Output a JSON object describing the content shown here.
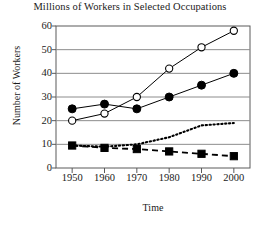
{
  "chart_data": {
    "type": "line",
    "title": "Millions of Workers in Selected Occupations",
    "xlabel": "Time",
    "ylabel": "Number of Workers",
    "x": [
      1950,
      1960,
      1970,
      1980,
      1990,
      2000
    ],
    "xtick_labels": [
      "1950",
      "1960",
      "1970",
      "1980",
      "1990",
      "2000"
    ],
    "ytick_labels": [
      "0",
      "10",
      "20",
      "30",
      "40",
      "50",
      "60"
    ],
    "yticks": [
      0,
      10,
      20,
      30,
      40,
      50,
      60
    ],
    "xlim": [
      1945,
      2005
    ],
    "ylim": [
      0,
      60
    ],
    "grid": "horizontal",
    "legend": "none",
    "series": [
      {
        "name": "open-circle-series",
        "marker": "open-circle",
        "line_style": "solid",
        "values": [
          20,
          23,
          30,
          42,
          51,
          58
        ]
      },
      {
        "name": "filled-circle-series",
        "marker": "filled-circle",
        "line_style": "solid",
        "values": [
          25,
          27,
          25,
          30,
          35,
          40
        ]
      },
      {
        "name": "dotted-series",
        "marker": "none",
        "line_style": "dotted",
        "values": [
          9.5,
          9,
          10,
          13,
          18,
          19
        ]
      },
      {
        "name": "filled-square-series",
        "marker": "filled-square",
        "line_style": "dashed",
        "values": [
          9.5,
          8.5,
          8,
          7,
          6,
          5
        ]
      }
    ]
  },
  "colors": {
    "line": "#000000",
    "grid": "#8c8c8c",
    "frame": "#5a5a5a",
    "text": "#1a1a1a",
    "background": "#ffffff"
  }
}
